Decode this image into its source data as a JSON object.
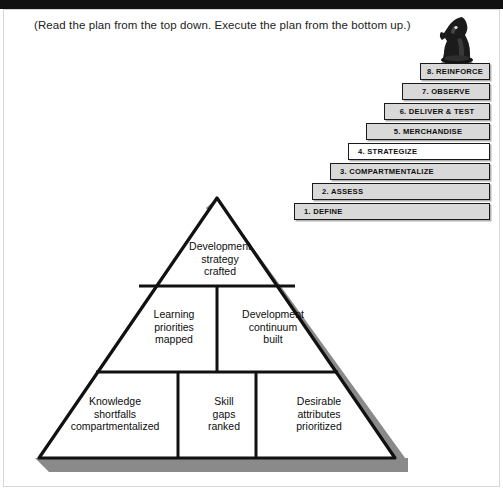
{
  "page": {
    "caption": "(Read the plan from the top down. Execute the plan from the bottom up.)",
    "knight_icon": "chess-knight-icon",
    "colors": {
      "top_bar": "#111111",
      "step_fill_gray": "#d9d9d9",
      "step_fill_white": "#ffffff",
      "outline": "#1a1a1a",
      "pyramid_shadow": "#8a8a8a",
      "pyramid_fill": "#ffffff"
    }
  },
  "staircase": {
    "name": "eight-step-staircase",
    "steps": [
      {
        "label": "1. DEFINE",
        "fill": "gray",
        "align": "left"
      },
      {
        "label": "2. ASSESS",
        "fill": "gray",
        "align": "left"
      },
      {
        "label": "3. COMPARTMENTALIZE",
        "fill": "gray",
        "align": "left"
      },
      {
        "label": "4. STRATEGIZE",
        "fill": "white",
        "align": "left"
      },
      {
        "label": "5. MERCHANDISE",
        "fill": "gray",
        "align": "center"
      },
      {
        "label": "6. DELIVER & TEST",
        "fill": "gray",
        "align": "center"
      },
      {
        "label": "7. OBSERVE",
        "fill": "gray",
        "align": "center"
      },
      {
        "label": "8. REINFORCE",
        "fill": "gray",
        "align": "center"
      }
    ]
  },
  "pyramid": {
    "name": "three-tier-pyramid",
    "tiers": [
      {
        "level": "apex",
        "cells": [
          {
            "text": "Development\nstrategy\ncrafted"
          }
        ]
      },
      {
        "level": "middle",
        "cells": [
          {
            "text": "Learning\npriorities\nmapped"
          },
          {
            "text": "Development\ncontinuum\nbuilt"
          }
        ]
      },
      {
        "level": "base",
        "cells": [
          {
            "text": "Knowledge\nshortfalls\ncompartmentalized"
          },
          {
            "text": "Skill\ngaps\nranked"
          },
          {
            "text": "Desirable\nattributes\nprioritized"
          }
        ]
      }
    ]
  }
}
